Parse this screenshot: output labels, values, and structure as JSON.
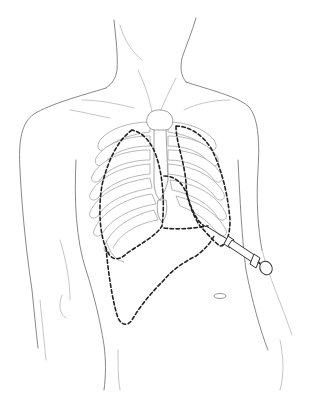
{
  "illustration": {
    "subject": "Anterior torso line drawing with rib cage, dashed organ outlines and syringe",
    "elements": {
      "torso_outline": "torso",
      "rib_cage": "rib-cage",
      "sternum": "sternum",
      "lung_outlines": "dashed lung outlines",
      "heart_outline": "dashed heart outline",
      "liver_outline": "dashed liver outline",
      "syringe": "syringe",
      "navel": "navel"
    },
    "colors": {
      "line": "#6a6a6a",
      "dashed_outline": "#222222",
      "background": "#ffffff"
    }
  }
}
